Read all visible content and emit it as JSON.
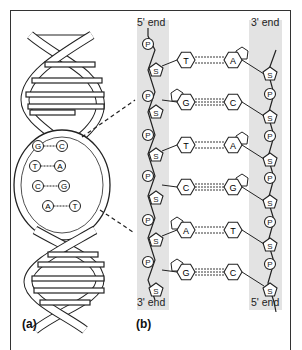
{
  "figure": {
    "panel_a_label": "(a)",
    "panel_b_label": "(b)",
    "left_strand": {
      "top_label": "5' end",
      "bottom_label": "3' end"
    },
    "right_strand": {
      "top_label": "3' end",
      "bottom_label": "5' end"
    },
    "phosphate_symbol": "P",
    "sugar_symbol": "S",
    "base_pairs": [
      {
        "left": "T",
        "right": "A"
      },
      {
        "left": "G",
        "right": "C"
      },
      {
        "left": "T",
        "right": "A"
      },
      {
        "left": "C",
        "right": "G"
      },
      {
        "left": "A",
        "right": "T"
      },
      {
        "left": "G",
        "right": "C"
      }
    ],
    "helix_inset_pairs": [
      {
        "left": "G",
        "right": "C"
      },
      {
        "left": "T",
        "right": "A"
      },
      {
        "left": "C",
        "right": "G"
      },
      {
        "left": "A",
        "right": "T"
      }
    ],
    "colors": {
      "band": "#e3e3e3",
      "line": "#222222",
      "border": "#333333"
    }
  }
}
